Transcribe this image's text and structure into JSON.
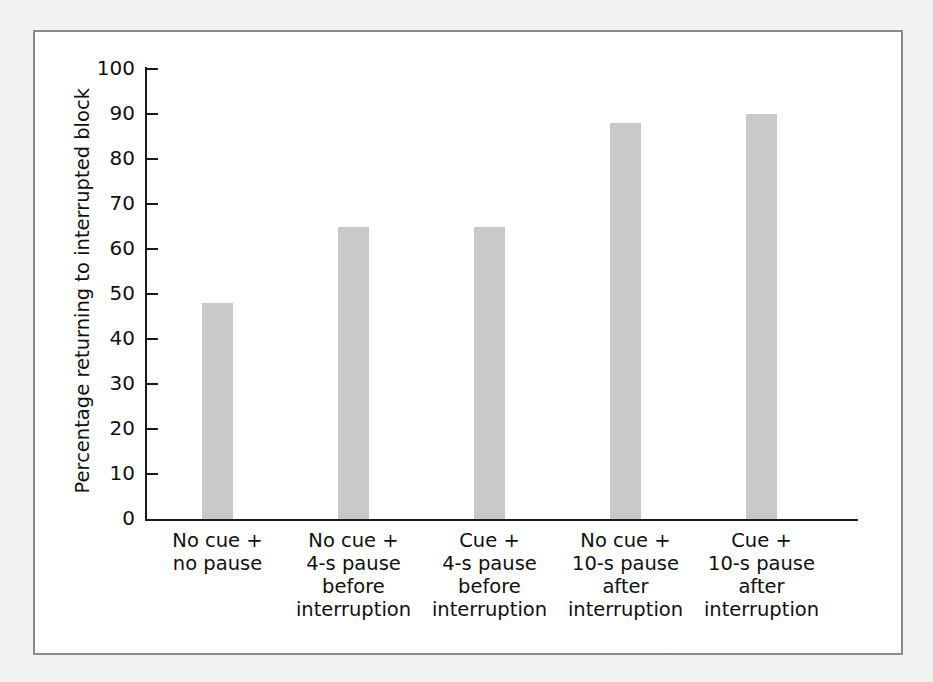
{
  "chart_data": {
    "type": "bar",
    "title": "",
    "xlabel": "",
    "ylabel": "Percentage returning to interrupted block",
    "ylim": [
      0,
      100
    ],
    "ytick_values": [
      0,
      10,
      20,
      30,
      40,
      50,
      60,
      70,
      80,
      90,
      100
    ],
    "ytick_labels": [
      "0",
      "10",
      "20",
      "30",
      "40",
      "50",
      "60",
      "70",
      "80",
      "90",
      "100"
    ],
    "grid": false,
    "legend": "none",
    "bar_color": "#c9c9c9",
    "axis_color": "#1a1a1a",
    "categories": [
      "No cue +\nno pause",
      "No cue +\n4-s pause\nbefore\ninterruption",
      "Cue +\n4-s pause\nbefore\ninterruption",
      "No cue +\n10-s pause\nafter\ninterruption",
      "Cue +\n10-s pause\nafter\ninterruption"
    ],
    "category_lines": [
      [
        "No cue +",
        "no pause"
      ],
      [
        "No cue +",
        "4-s pause",
        "before",
        "interruption"
      ],
      [
        "Cue +",
        "4-s pause",
        "before",
        "interruption"
      ],
      [
        "No cue +",
        "10-s pause",
        "after",
        "interruption"
      ],
      [
        "Cue +",
        "10-s pause",
        "after",
        "interruption"
      ]
    ],
    "values": [
      48,
      65,
      65,
      88,
      90
    ]
  },
  "figure": {
    "frame_color": "#8a8a8a",
    "background": "#ffffff",
    "page_background": "#f2f2f0"
  }
}
